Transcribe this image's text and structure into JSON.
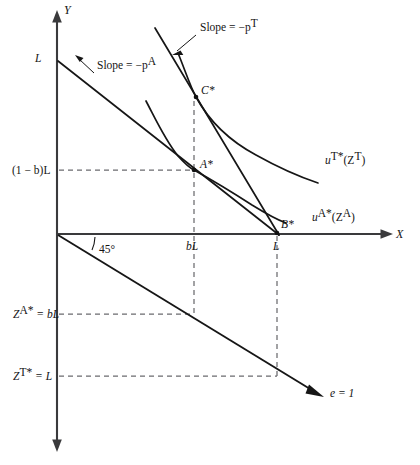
{
  "figure": {
    "type": "economics-diagram",
    "axes": {
      "vertical_label": "Y",
      "horizontal_label": "X"
    },
    "colors": {
      "axis": "#3a3a3c",
      "curve": "#161616",
      "dashed": "#6b6b6f",
      "text": "#141414"
    }
  },
  "labels": {
    "y_axis": "Y",
    "x_axis": "X",
    "endowment_L": "L",
    "slope_pa": "Slope = −p",
    "slope_pa_sup": "A",
    "slope_pt": "Slope = −p",
    "slope_pt_sup": "T",
    "point_a": "A*",
    "point_b": "B*",
    "point_c": "C*",
    "y_tick_1mb_L": "(1 − b)L",
    "x_tick_bL": "bL",
    "x_tick_L": "L",
    "angle_45": "45°",
    "util_t_base": "u",
    "util_t_sup": "T*",
    "util_t_arg": "(Z",
    "util_t_arg_sup": "T",
    "util_t_close": ")",
    "util_a_base": "u",
    "util_a_sup": "A*",
    "util_a_arg": "(Z",
    "util_a_arg_sup": "A",
    "util_a_close": ")",
    "z_a_star_base": "Z",
    "z_a_star_sup": "A*",
    "z_a_star_eq": " = bL",
    "z_t_star_base": "Z",
    "z_t_star_sup": "T*",
    "z_t_star_eq": " = L",
    "ray_label": "e = 1"
  },
  "geometry": {
    "origin": {
      "x": 57,
      "y": 234
    },
    "y_axis_top": 12,
    "y_axis_bottom": 450,
    "x_axis_right": 392,
    "points": {
      "A": {
        "x": 194,
        "y": 170
      },
      "B": {
        "x": 277,
        "y": 233
      },
      "C": {
        "x": 196,
        "y": 97
      }
    },
    "ticks": {
      "bL_x": 194,
      "L_x": 277,
      "one_minus_b_L_y": 170,
      "Z_A_star_y": 314,
      "Z_T_star_y": 376
    }
  }
}
